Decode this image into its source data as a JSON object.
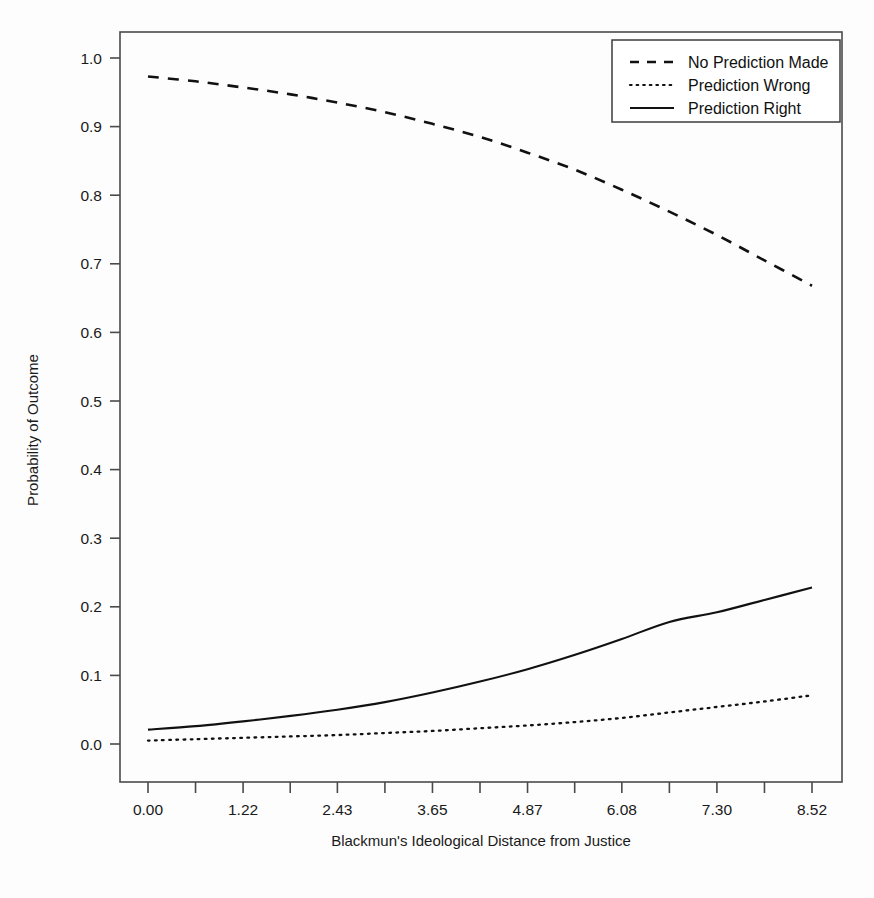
{
  "chart_data": {
    "type": "line",
    "title": "",
    "xlabel": "Blackmun's Ideological Distance from Justice",
    "ylabel": "Probability of Outcome",
    "xlim": [
      0.0,
      8.52
    ],
    "ylim": [
      0.0,
      1.0
    ],
    "grid": false,
    "legend_position": "top-right",
    "xticks": [
      "0.00",
      "1.22",
      "2.43",
      "3.65",
      "4.87",
      "6.08",
      "7.30",
      "8.52"
    ],
    "xtick_values": [
      0.0,
      1.22,
      2.43,
      3.65,
      4.87,
      6.08,
      7.3,
      8.52
    ],
    "minor_xticks": [
      0.61,
      1.825,
      3.04,
      4.26,
      5.475,
      6.69,
      7.91
    ],
    "yticks": [
      "0.0",
      "0.1",
      "0.2",
      "0.3",
      "0.4",
      "0.5",
      "0.6",
      "0.7",
      "0.8",
      "0.9",
      "1.0"
    ],
    "ytick_values": [
      0.0,
      0.1,
      0.2,
      0.3,
      0.4,
      0.5,
      0.6,
      0.7,
      0.8,
      0.9,
      1.0
    ],
    "x": [
      0.0,
      0.61,
      1.22,
      1.83,
      2.43,
      3.04,
      3.65,
      4.26,
      4.87,
      5.48,
      6.08,
      6.69,
      7.3,
      7.91,
      8.52
    ],
    "series": [
      {
        "name": "No Prediction Made",
        "style": "dashed",
        "color": "#111111",
        "values": [
          0.973,
          0.966,
          0.957,
          0.947,
          0.935,
          0.921,
          0.904,
          0.885,
          0.862,
          0.837,
          0.808,
          0.776,
          0.742,
          0.705,
          0.668
        ]
      },
      {
        "name": "Prediction Wrong",
        "style": "dotted",
        "color": "#111111",
        "values": [
          0.005,
          0.007,
          0.009,
          0.011,
          0.013,
          0.016,
          0.019,
          0.023,
          0.027,
          0.032,
          0.038,
          0.046,
          0.054,
          0.062,
          0.071
        ]
      },
      {
        "name": "Prediction Right",
        "style": "solid",
        "color": "#111111",
        "values": [
          0.021,
          0.026,
          0.033,
          0.041,
          0.05,
          0.061,
          0.075,
          0.091,
          0.109,
          0.13,
          0.153,
          0.178,
          0.192,
          0.21,
          0.228
        ]
      }
    ]
  },
  "legend": {
    "entries": [
      {
        "label": "No Prediction Made",
        "style": "dashed"
      },
      {
        "label": "Prediction Wrong",
        "style": "dotted"
      },
      {
        "label": "Prediction Right",
        "style": "solid"
      }
    ]
  },
  "axes": {
    "x_title": "Blackmun's Ideological Distance from Justice",
    "y_title": "Probability of Outcome"
  }
}
